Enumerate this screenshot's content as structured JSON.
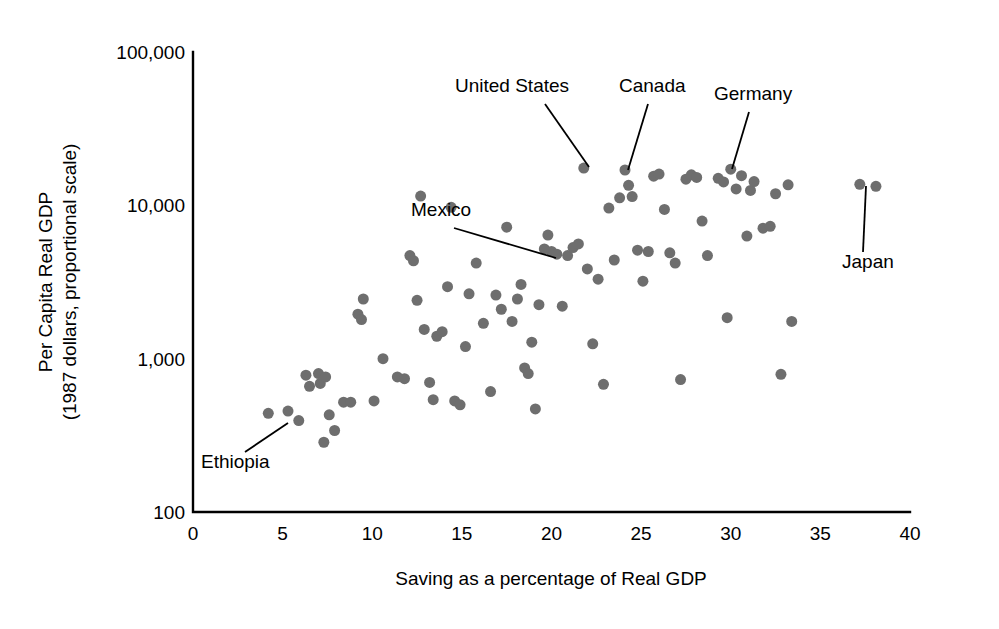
{
  "chart_data": {
    "type": "scatter",
    "title": "",
    "xlabel": "Saving as a percentage of Real GDP",
    "ylabel_line1": "Per Capita Real GDP",
    "ylabel_line2": "(1987 dollars, proportional scale)",
    "xlim": [
      0,
      40
    ],
    "ylim": [
      100,
      100000
    ],
    "yscale": "log",
    "grid": false,
    "legend": null,
    "xticks": [
      0,
      5,
      10,
      15,
      20,
      25,
      30,
      35,
      40
    ],
    "xtick_labels": [
      "0",
      "5",
      "10",
      "15",
      "20",
      "25",
      "30",
      "35",
      "40"
    ],
    "yticks": [
      100,
      1000,
      10000,
      100000
    ],
    "ytick_labels": [
      "100",
      "1,000",
      "10,000",
      "100,000"
    ],
    "marker_color": "#6e6e6e",
    "marker_size": 11,
    "points": [
      {
        "x": 4.2,
        "y": 440
      },
      {
        "x": 5.3,
        "y": 455
      },
      {
        "x": 5.9,
        "y": 395
      },
      {
        "x": 6.3,
        "y": 780
      },
      {
        "x": 6.5,
        "y": 660
      },
      {
        "x": 7.0,
        "y": 800
      },
      {
        "x": 7.1,
        "y": 690
      },
      {
        "x": 7.3,
        "y": 285
      },
      {
        "x": 7.4,
        "y": 760
      },
      {
        "x": 7.6,
        "y": 430
      },
      {
        "x": 7.9,
        "y": 340
      },
      {
        "x": 8.4,
        "y": 520
      },
      {
        "x": 8.8,
        "y": 520
      },
      {
        "x": 9.2,
        "y": 1950
      },
      {
        "x": 9.4,
        "y": 1800
      },
      {
        "x": 9.5,
        "y": 2450
      },
      {
        "x": 10.1,
        "y": 530
      },
      {
        "x": 10.6,
        "y": 1000
      },
      {
        "x": 11.4,
        "y": 760
      },
      {
        "x": 11.8,
        "y": 740
      },
      {
        "x": 12.1,
        "y": 4700
      },
      {
        "x": 12.3,
        "y": 4350
      },
      {
        "x": 12.5,
        "y": 2400
      },
      {
        "x": 12.7,
        "y": 11500
      },
      {
        "x": 12.9,
        "y": 1550
      },
      {
        "x": 13.2,
        "y": 700
      },
      {
        "x": 13.4,
        "y": 540
      },
      {
        "x": 13.6,
        "y": 1400
      },
      {
        "x": 13.9,
        "y": 1500
      },
      {
        "x": 14.2,
        "y": 2950
      },
      {
        "x": 14.4,
        "y": 9700
      },
      {
        "x": 14.6,
        "y": 530
      },
      {
        "x": 14.9,
        "y": 500
      },
      {
        "x": 15.2,
        "y": 1200
      },
      {
        "x": 15.4,
        "y": 2650
      },
      {
        "x": 15.8,
        "y": 4200
      },
      {
        "x": 16.2,
        "y": 1700
      },
      {
        "x": 16.6,
        "y": 610
      },
      {
        "x": 16.9,
        "y": 2600
      },
      {
        "x": 17.2,
        "y": 2100
      },
      {
        "x": 17.5,
        "y": 7200
      },
      {
        "x": 17.8,
        "y": 1750
      },
      {
        "x": 18.1,
        "y": 2450
      },
      {
        "x": 18.3,
        "y": 3050
      },
      {
        "x": 18.5,
        "y": 870
      },
      {
        "x": 18.7,
        "y": 800
      },
      {
        "x": 18.9,
        "y": 1280
      },
      {
        "x": 19.1,
        "y": 470
      },
      {
        "x": 19.3,
        "y": 2250
      },
      {
        "x": 19.6,
        "y": 5200
      },
      {
        "x": 19.8,
        "y": 6400
      },
      {
        "x": 20.0,
        "y": 5000
      },
      {
        "x": 20.3,
        "y": 4800
      },
      {
        "x": 20.6,
        "y": 2200
      },
      {
        "x": 20.9,
        "y": 4700
      },
      {
        "x": 21.2,
        "y": 5300
      },
      {
        "x": 21.5,
        "y": 5600
      },
      {
        "x": 21.8,
        "y": 17500
      },
      {
        "x": 22.0,
        "y": 3850
      },
      {
        "x": 22.3,
        "y": 1250
      },
      {
        "x": 22.6,
        "y": 3300
      },
      {
        "x": 22.9,
        "y": 680
      },
      {
        "x": 23.2,
        "y": 9600
      },
      {
        "x": 23.5,
        "y": 4400
      },
      {
        "x": 23.8,
        "y": 11200
      },
      {
        "x": 24.1,
        "y": 17000
      },
      {
        "x": 24.3,
        "y": 13500
      },
      {
        "x": 24.5,
        "y": 11400
      },
      {
        "x": 24.8,
        "y": 5100
      },
      {
        "x": 25.1,
        "y": 3200
      },
      {
        "x": 25.4,
        "y": 5000
      },
      {
        "x": 25.7,
        "y": 15500
      },
      {
        "x": 26.0,
        "y": 16000
      },
      {
        "x": 26.3,
        "y": 9400
      },
      {
        "x": 26.6,
        "y": 4900
      },
      {
        "x": 26.9,
        "y": 4200
      },
      {
        "x": 27.2,
        "y": 730
      },
      {
        "x": 27.5,
        "y": 14800
      },
      {
        "x": 27.8,
        "y": 15800
      },
      {
        "x": 28.1,
        "y": 15200
      },
      {
        "x": 28.4,
        "y": 7900
      },
      {
        "x": 28.7,
        "y": 4700
      },
      {
        "x": 29.3,
        "y": 15000
      },
      {
        "x": 29.6,
        "y": 14200
      },
      {
        "x": 29.8,
        "y": 1850
      },
      {
        "x": 30.0,
        "y": 17200
      },
      {
        "x": 30.3,
        "y": 12800
      },
      {
        "x": 30.6,
        "y": 15600
      },
      {
        "x": 30.9,
        "y": 6300
      },
      {
        "x": 31.1,
        "y": 12500
      },
      {
        "x": 31.3,
        "y": 14300
      },
      {
        "x": 31.8,
        "y": 7100
      },
      {
        "x": 32.2,
        "y": 7300
      },
      {
        "x": 32.5,
        "y": 11900
      },
      {
        "x": 32.8,
        "y": 790
      },
      {
        "x": 33.2,
        "y": 13600
      },
      {
        "x": 33.4,
        "y": 1750
      },
      {
        "x": 37.2,
        "y": 13700
      },
      {
        "x": 38.1,
        "y": 13300
      }
    ],
    "annotations": [
      {
        "label": "United States",
        "label_x": 455,
        "label_y": 92,
        "leader_from_x": 545,
        "leader_from_y": 104,
        "point_x": 589,
        "point_y": 167
      },
      {
        "label": "Canada",
        "label_x": 619,
        "label_y": 92,
        "leader_from_x": 648,
        "leader_from_y": 104,
        "point_x": 628,
        "point_y": 170
      },
      {
        "label": "Germany",
        "label_x": 714,
        "label_y": 100,
        "leader_from_x": 749,
        "leader_from_y": 112,
        "point_x": 732,
        "point_y": 169
      },
      {
        "label": "Mexico",
        "label_x": 411,
        "label_y": 216,
        "leader_from_x": 454,
        "leader_from_y": 228,
        "point_x": 556,
        "point_y": 258
      },
      {
        "label": "Japan",
        "label_x": 842,
        "label_y": 268,
        "leader_from_x": 863,
        "leader_from_y": 252,
        "point_x": 866,
        "point_y": 186
      },
      {
        "label": "Ethiopia",
        "label_x": 201,
        "label_y": 468,
        "leader_from_x": 245,
        "leader_from_y": 452,
        "point_x": 288,
        "point_y": 423
      }
    ]
  }
}
